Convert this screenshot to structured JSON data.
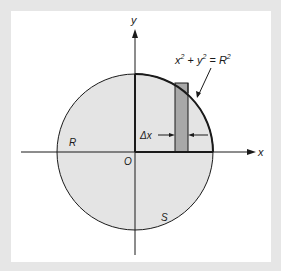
{
  "figure": {
    "labels": {
      "y_axis": "y",
      "x_axis": "x",
      "origin": "O",
      "region_r": "R",
      "region_s": "S",
      "delta_x": "Δx",
      "equation": {
        "x": "x",
        "exp1": "2",
        "plus": " + ",
        "y": "y",
        "exp2": "2",
        "equals": " = ",
        "R": "R",
        "exp3": "2"
      }
    },
    "colors": {
      "background": "#e6e6e6",
      "panel": "#ffffff",
      "circle_fill": "#e4e4e4",
      "strip_fill": "#a8a8a8",
      "stroke": "#1a1a1a"
    }
  }
}
